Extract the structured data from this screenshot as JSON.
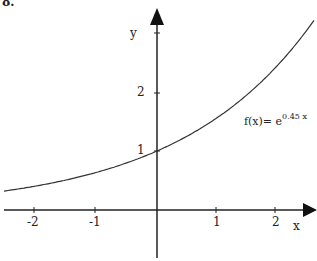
{
  "problem_number": "8.",
  "chart_data": {
    "type": "line",
    "title": "",
    "function_label": "f(x)= e",
    "function_exponent": "0.45 x",
    "xlabel": "x",
    "ylabel": "y",
    "x_ticks": [
      "-2",
      "-1",
      "1",
      "2"
    ],
    "y_ticks": [
      "1",
      "2"
    ],
    "xlim": [
      -2.55,
      2.65
    ],
    "ylim": [
      -0.9,
      3.3
    ],
    "grid": false,
    "series": [
      {
        "name": "f(x)=e^(0.45x)",
        "x": [
          -2.5,
          -2,
          -1.5,
          -1,
          -0.5,
          0,
          0.5,
          1,
          1.5,
          2,
          2.5
        ],
        "y": [
          0.32,
          0.41,
          0.51,
          0.64,
          0.8,
          1.0,
          1.25,
          1.57,
          1.96,
          2.46,
          3.08
        ]
      }
    ]
  }
}
